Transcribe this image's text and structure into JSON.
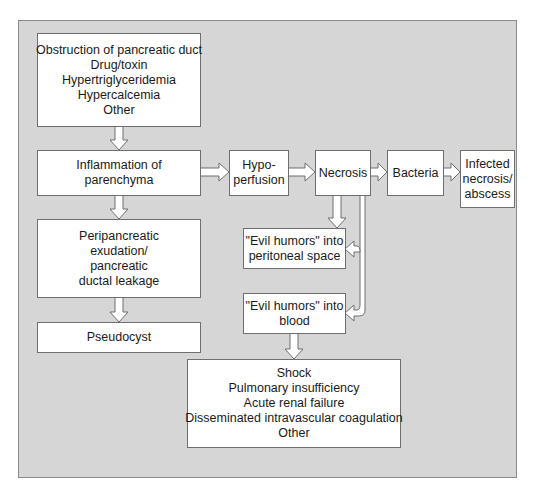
{
  "diagram": {
    "type": "flowchart",
    "colors": {
      "panel_background": "#d6d6d6",
      "box_fill": "#ffffff",
      "border": "#6f6f6f"
    },
    "nodes": {
      "causes": {
        "lines": [
          "Obstruction of pancreatic duct",
          "Drug/toxin",
          "Hypertriglyceridemia",
          "Hypercalcemia",
          "Other"
        ]
      },
      "inflammation": {
        "lines": [
          "Inflammation of",
          "parenchyma"
        ]
      },
      "hypoperfusion": {
        "lines": [
          "Hypo-",
          "perfusion"
        ]
      },
      "necrosis": {
        "lines": [
          "Necrosis"
        ]
      },
      "bacteria": {
        "lines": [
          "Bacteria"
        ]
      },
      "infected": {
        "lines": [
          "Infected",
          "necrosis/",
          "abscess"
        ]
      },
      "exudation": {
        "lines": [
          "Peripancreatic",
          "exudation/",
          "pancreatic",
          "ductal leakage"
        ]
      },
      "pseudocyst": {
        "lines": [
          "Pseudocyst"
        ]
      },
      "evil_peritoneal": {
        "lines": [
          "\"Evil humors\" into",
          "peritoneal space"
        ]
      },
      "evil_blood": {
        "lines": [
          "\"Evil humors\" into",
          "blood"
        ]
      },
      "outcomes": {
        "lines": [
          "Shock",
          "Pulmonary insufficiency",
          "Acute renal failure",
          "Disseminated intravascular coagulation",
          "Other"
        ]
      }
    },
    "edges": [
      {
        "from": "causes",
        "to": "inflammation"
      },
      {
        "from": "inflammation",
        "to": "hypoperfusion"
      },
      {
        "from": "inflammation",
        "to": "exudation"
      },
      {
        "from": "hypoperfusion",
        "to": "necrosis"
      },
      {
        "from": "necrosis",
        "to": "bacteria"
      },
      {
        "from": "bacteria",
        "to": "infected"
      },
      {
        "from": "necrosis",
        "to": "evil_peritoneal"
      },
      {
        "from": "necrosis",
        "to": "evil_blood"
      },
      {
        "from": "exudation",
        "to": "pseudocyst"
      },
      {
        "from": "evil_blood",
        "to": "outcomes"
      }
    ]
  }
}
